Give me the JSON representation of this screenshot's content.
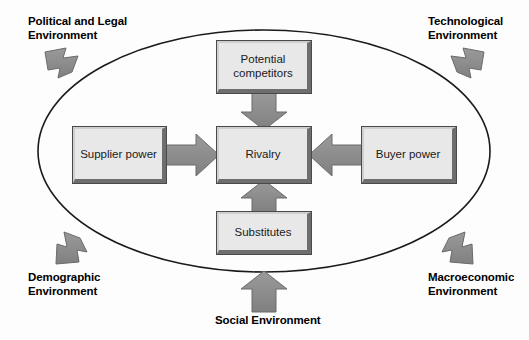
{
  "diagram": {
    "boundary": {
      "shape": "ellipse",
      "name": "industry-environment-boundary",
      "stroke_color": "#1a1a1a"
    },
    "colors": {
      "box_fill": "#e8e8e8",
      "box_border_dark": "#4a4a4a",
      "box_shadow": "#6e6e6e",
      "arrow_fill": "#8a8a8a",
      "arrow_stroke": "#6b6b6b",
      "text": "#1a1a1a",
      "background": "#ffffff"
    },
    "forces": [
      {
        "id": "potential-competitors",
        "label": "Potential\ncompetitors",
        "position": "top"
      },
      {
        "id": "supplier-power",
        "label": "Supplier\npower",
        "position": "left"
      },
      {
        "id": "rivalry",
        "label": "Rivalry",
        "position": "center"
      },
      {
        "id": "buyer-power",
        "label": "Buyer\npower",
        "position": "right"
      },
      {
        "id": "substitutes",
        "label": "Substitutes",
        "position": "bottom"
      }
    ],
    "inner_arrows": [
      {
        "id": "arrow-potential-to-rivalry",
        "from": "potential-competitors",
        "to": "rivalry",
        "direction": "down"
      },
      {
        "id": "arrow-supplier-to-rivalry",
        "from": "supplier-power",
        "to": "rivalry",
        "direction": "right"
      },
      {
        "id": "arrow-buyer-to-rivalry",
        "from": "buyer-power",
        "to": "rivalry",
        "direction": "left"
      },
      {
        "id": "arrow-substitutes-to-rivalry",
        "from": "substitutes",
        "to": "rivalry",
        "direction": "up"
      }
    ],
    "environment_factors": [
      {
        "id": "political-legal",
        "label": "Political and Legal\nEnvironment",
        "corner": "top-left",
        "arrow_direction": "down-right"
      },
      {
        "id": "technological",
        "label": "Technological\nEnvironment",
        "corner": "top-right",
        "arrow_direction": "down-left"
      },
      {
        "id": "demographic",
        "label": "Demographic\nEnvironment",
        "corner": "bottom-left",
        "arrow_direction": "up-right"
      },
      {
        "id": "macroeconomic",
        "label": "Macroeconomic\nEnvironment",
        "corner": "bottom-right",
        "arrow_direction": "up-left"
      },
      {
        "id": "social",
        "label": "Social Environment",
        "corner": "bottom-center",
        "arrow_direction": "up"
      }
    ]
  }
}
